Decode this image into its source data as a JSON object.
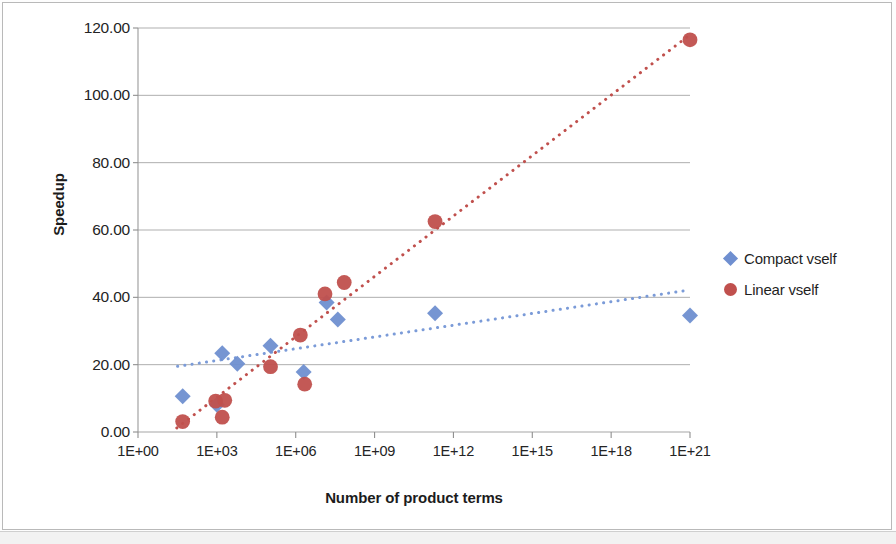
{
  "chart_data": {
    "type": "scatter",
    "title": "",
    "xlabel": "Number of product terms",
    "ylabel": "Speedup",
    "xscale": "log",
    "xlim": [
      1,
      1e+21
    ],
    "ylim": [
      0,
      120
    ],
    "grid": "horizontal",
    "legend_position": "right",
    "xticks": [
      "1E+00",
      "1E+03",
      "1E+06",
      "1E+09",
      "1E+12",
      "1E+15",
      "1E+18",
      "1E+21"
    ],
    "xtick_values": [
      1,
      1000,
      1000000,
      1000000000,
      1000000000000,
      1000000000000000,
      1e+18,
      1e+21
    ],
    "yticks": [
      "0.00",
      "20.00",
      "40.00",
      "60.00",
      "80.00",
      "100.00",
      "120.00"
    ],
    "ytick_values": [
      0,
      20,
      40,
      60,
      80,
      100,
      120
    ],
    "series": [
      {
        "name": "Compact vself",
        "color": "#6f8fd0",
        "marker": "diamond",
        "trendline": {
          "style": "dotted",
          "color": "#7b9bd8",
          "x_start": 32.0,
          "y_start": 19.5,
          "x_end": 1e+21,
          "y_end": 42.2
        },
        "points": [
          {
            "x": 50.0,
            "y": 10.6
          },
          {
            "x": 1600.0,
            "y": 23.4
          },
          {
            "x": 6000.0,
            "y": 20.3
          },
          {
            "x": 1000.0,
            "y": 8.1
          },
          {
            "x": 110000.0,
            "y": 25.6
          },
          {
            "x": 2000000.0,
            "y": 17.8
          },
          {
            "x": 15000000.0,
            "y": 38.5
          },
          {
            "x": 40000000.0,
            "y": 33.4
          },
          {
            "x": 200000000000.0,
            "y": 35.3
          },
          {
            "x": 1e+21,
            "y": 34.6
          }
        ]
      },
      {
        "name": "Linear vself",
        "color": "#c0504d",
        "marker": "circle",
        "trendline": {
          "style": "dotted",
          "color": "#c0504d",
          "x_start": 30.0,
          "y_start": 1.2,
          "x_end": 1e+21,
          "y_end": 118.0
        },
        "points": [
          {
            "x": 50.0,
            "y": 3.1
          },
          {
            "x": 900.0,
            "y": 9.2
          },
          {
            "x": 2000.0,
            "y": 9.4
          },
          {
            "x": 1600.0,
            "y": 4.4
          },
          {
            "x": 110000.0,
            "y": 19.4
          },
          {
            "x": 1500000.0,
            "y": 28.8
          },
          {
            "x": 2200000.0,
            "y": 14.2
          },
          {
            "x": 13000000.0,
            "y": 41.0
          },
          {
            "x": 70000000.0,
            "y": 44.4
          },
          {
            "x": 200000000000.0,
            "y": 62.5
          },
          {
            "x": 1e+21,
            "y": 116.5
          }
        ]
      }
    ]
  }
}
